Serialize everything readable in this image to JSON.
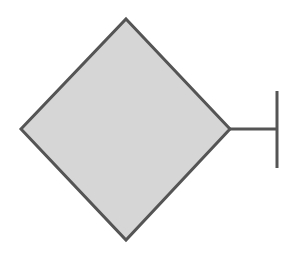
{
  "diagram": {
    "shapes": [
      {
        "type": "diamond",
        "fill": "#d6d6d6",
        "stroke": "#555555",
        "points": [
          [
            126,
            19
          ],
          [
            230,
            129
          ],
          [
            126,
            240
          ],
          [
            21,
            129
          ]
        ]
      },
      {
        "type": "connector-line",
        "stroke": "#555555",
        "from": [
          230,
          129
        ],
        "to": [
          277,
          129
        ]
      },
      {
        "type": "bar-terminator",
        "stroke": "#555555",
        "from": [
          277,
          91
        ],
        "to": [
          277,
          168
        ]
      }
    ]
  }
}
